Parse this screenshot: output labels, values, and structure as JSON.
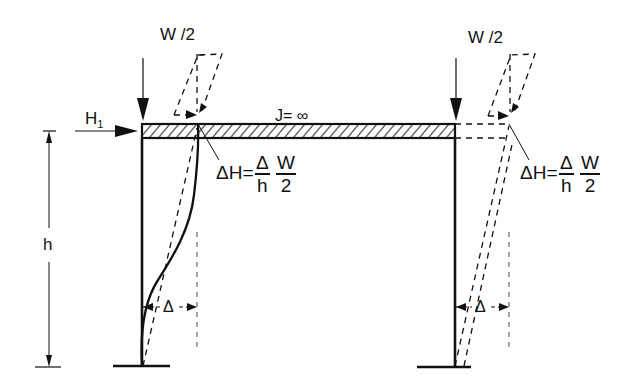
{
  "diagram": {
    "type": "portal-frame-p-delta",
    "loads": {
      "left_vertical": "W /2",
      "right_vertical": "W /2",
      "horizontal": "H",
      "horizontal_subscript": "1"
    },
    "beam": {
      "stiffness_label": "J= ∞"
    },
    "height_label": "h",
    "left_annotation": {
      "lhs": "ΔH=",
      "frac1_num": "Δ",
      "frac1_den": "h",
      "frac2_num": "W",
      "frac2_den": "2"
    },
    "right_annotation": {
      "lhs": "ΔH=",
      "frac1_num": "Δ",
      "frac1_den": "h",
      "frac2_num": "W",
      "frac2_den": "2"
    },
    "left_drift_label": "Δ",
    "right_drift_label": "Δ",
    "colors": {
      "line": "#111111",
      "background": "#ffffff"
    }
  }
}
